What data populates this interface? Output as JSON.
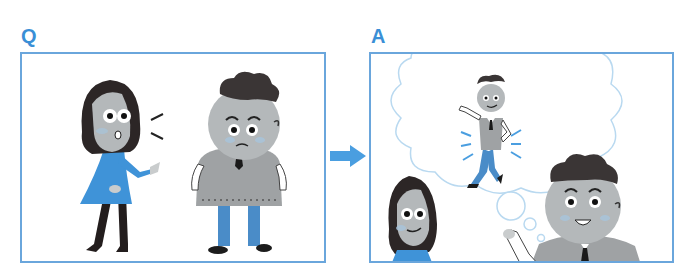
{
  "colors": {
    "accent": "#3a8fd6",
    "frame": "#6aa6dc",
    "cloud": "#b9d9f0",
    "dress_blue": "#3f93d8",
    "jeans_blue": "#4a8cc8",
    "skin_gray": "#b4b8ba",
    "hair_dark": "#2c2626",
    "sweater_gray": "#9fa2a4"
  },
  "question_panel": {
    "label": "Q",
    "scene": "woman speaking to a worried, heavy-set man",
    "characters": [
      {
        "name": "woman",
        "expression": "surprised, talking",
        "outfit": "blue dress, black tights"
      },
      {
        "name": "man",
        "expression": "worried",
        "outfit": "gray sweater vest, tie, blue trousers"
      }
    ]
  },
  "transition": {
    "icon": "right-arrow-icon"
  },
  "answer_panel": {
    "label": "A",
    "scene": "man imagines himself slim and energetic in a thought bubble",
    "characters": [
      {
        "name": "woman",
        "expression": "smiling"
      },
      {
        "name": "man",
        "expression": "happy, hopeful"
      },
      {
        "name": "imagined-slim-man",
        "expression": "confident",
        "outfit": "gray vest, tie, blue jeans"
      }
    ]
  }
}
